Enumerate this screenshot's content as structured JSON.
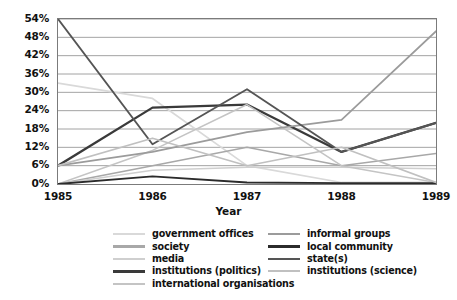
{
  "chart_data": {
    "type": "line",
    "title": "",
    "xlabel": "Year",
    "ylabel": "",
    "x": [
      "1985",
      "1986",
      "1987",
      "1988",
      "1989"
    ],
    "categories": [
      "1985",
      "1986",
      "1987",
      "1988",
      "1989"
    ],
    "ylim": [
      0,
      54
    ],
    "yticks": [
      0,
      6,
      12,
      18,
      24,
      30,
      36,
      42,
      48,
      54
    ],
    "ytick_labels": [
      "0%",
      "6%",
      "12%",
      "18%",
      "24%",
      "30%",
      "36%",
      "42%",
      "48%",
      "54%"
    ],
    "grid": true,
    "legend_position": "bottom",
    "series": [
      {
        "name": "government offices",
        "values": [
          33.0,
          28.0,
          6.0,
          0.5,
          0.5
        ],
        "color": "#d9d9d9",
        "width": 1.7
      },
      {
        "name": "society",
        "values": [
          0.0,
          6.0,
          12.0,
          6.0,
          10.0
        ],
        "color": "#a8a8a8",
        "width": 1.6
      },
      {
        "name": "media",
        "values": [
          0.0,
          4.5,
          5.5,
          5.5,
          5.0
        ],
        "color": "#cfcfcf",
        "width": 1.6
      },
      {
        "name": "institutions (politics)",
        "values": [
          6.0,
          25.0,
          26.0,
          10.5,
          20.0
        ],
        "color": "#3a3a3a",
        "width": 2.3
      },
      {
        "name": "international organisations",
        "values": [
          0.0,
          11.0,
          26.0,
          6.0,
          0.5
        ],
        "color": "#c4c4c4",
        "width": 1.6
      },
      {
        "name": "informal groups",
        "values": [
          6.0,
          10.5,
          17.0,
          21.0,
          50.0
        ],
        "color": "#9b9b9b",
        "width": 1.7
      },
      {
        "name": "local community",
        "values": [
          0.0,
          2.5,
          0.5,
          0.3,
          0.3
        ],
        "color": "#2b2b2b",
        "width": 1.9
      },
      {
        "name": "state(s)",
        "values": [
          54.0,
          13.0,
          31.0,
          10.5,
          20.0
        ],
        "color": "#555555",
        "width": 1.9
      },
      {
        "name": "institutions (science)",
        "values": [
          6.0,
          15.0,
          6.0,
          12.0,
          0.5
        ],
        "color": "#c0c0c0",
        "width": 1.6
      }
    ]
  },
  "legend": {
    "left_column": [
      {
        "label": "government offices"
      },
      {
        "label": "society"
      },
      {
        "label": "media"
      },
      {
        "label": "institutions (politics)"
      },
      {
        "label": "international organisations"
      }
    ],
    "right_column": [
      {
        "label": "informal groups"
      },
      {
        "label": "local community"
      },
      {
        "label": "state(s)"
      },
      {
        "label": "institutions (science)"
      }
    ]
  },
  "axis": {
    "x_title": "Year"
  }
}
